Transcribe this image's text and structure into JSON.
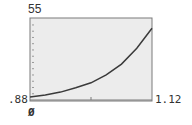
{
  "window": {
    "xmin_label": ".88",
    "xmax_label": "1.12",
    "ymin_label": "Ø",
    "ymax_label": "55"
  },
  "colors": {
    "screen_bg": "#ececec",
    "border": "#7a7a7a",
    "curve": "#3a3a3a"
  },
  "chart_data": {
    "type": "line",
    "title": "",
    "xlabel": "",
    "ylabel": "",
    "xlim": [
      0.88,
      1.12
    ],
    "ylim": [
      0,
      55
    ],
    "grid": false,
    "x_ticks": [
      1.0
    ],
    "y_tick_count": 12,
    "series": [
      {
        "name": "curve",
        "x": [
          0.88,
          0.91,
          0.94,
          0.97,
          1.0,
          1.03,
          1.06,
          1.09,
          1.12
        ],
        "y": [
          2,
          3.5,
          5.5,
          8.5,
          12,
          17.5,
          25,
          36,
          50
        ]
      }
    ]
  }
}
